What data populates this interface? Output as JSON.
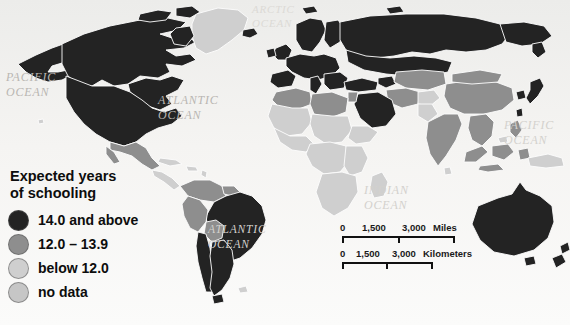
{
  "figure": {
    "type": "choropleth-world-map",
    "background_color": "#f4f3f1"
  },
  "legend": {
    "title": "Expected years\nof schooling",
    "items": [
      {
        "label": "14.0 and above",
        "color": "#232323"
      },
      {
        "label": "12.0 – 13.9",
        "color": "#8e8e8e"
      },
      {
        "label": "below 12.0",
        "color": "#cfcfcf"
      },
      {
        "label": "no data",
        "color": "#c6c6c6"
      }
    ]
  },
  "ocean_labels": [
    {
      "id": "arctic-ocean",
      "text": "ARCTIC\nOCEAN",
      "x": 252,
      "y": 2,
      "size": 11,
      "tone": "vfaint"
    },
    {
      "id": "pacific-ocean-west",
      "text": "PACIFIC\nOCEAN",
      "x": 6,
      "y": 70,
      "size": 12,
      "tone": "normal"
    },
    {
      "id": "atlantic-ocean-north",
      "text": "ATLANTIC\nOCEAN",
      "x": 158,
      "y": 93,
      "size": 12,
      "tone": "normal"
    },
    {
      "id": "pacific-ocean-east",
      "text": "PACIFIC\nOCEAN",
      "x": 504,
      "y": 118,
      "size": 12,
      "tone": "faint"
    },
    {
      "id": "indian-ocean",
      "text": "INDIAN\nOCEAN",
      "x": 364,
      "y": 183,
      "size": 12,
      "tone": "faint"
    },
    {
      "id": "atlantic-ocean-south",
      "text": "ATLANTIC\nOCEAN",
      "x": 208,
      "y": 222,
      "size": 11.5,
      "tone": "faint"
    }
  ],
  "scalebar": {
    "miles": {
      "unit_label": "Miles",
      "ticks": [
        "0",
        "1,500",
        "3,000"
      ]
    },
    "kilometers": {
      "unit_label": "Kilometers",
      "ticks": [
        "0",
        "1,500",
        "3,000"
      ]
    }
  },
  "chart_data": {
    "type": "map",
    "title": "Expected years of schooling",
    "classes": [
      {
        "label": "14.0 and above",
        "color": "#232323"
      },
      {
        "label": "12.0 – 13.9",
        "color": "#8e8e8e"
      },
      {
        "label": "below 12.0",
        "color": "#cfcfcf"
      },
      {
        "label": "no data",
        "color": "#c6c6c6"
      }
    ],
    "regions": [
      {
        "name": "Canada",
        "class": "14.0 and above"
      },
      {
        "name": "United States",
        "class": "14.0 and above"
      },
      {
        "name": "Greenland",
        "class": "below 12.0"
      },
      {
        "name": "Mexico",
        "class": "12.0 – 13.9"
      },
      {
        "name": "Central America",
        "class": "below 12.0"
      },
      {
        "name": "Caribbean",
        "class": "below 12.0"
      },
      {
        "name": "Venezuela",
        "class": "12.0 – 13.9"
      },
      {
        "name": "Colombia",
        "class": "12.0 – 13.9"
      },
      {
        "name": "Peru",
        "class": "12.0 – 13.9"
      },
      {
        "name": "Bolivia",
        "class": "12.0 – 13.9"
      },
      {
        "name": "Brazil",
        "class": "14.0 and above"
      },
      {
        "name": "Argentina",
        "class": "14.0 and above"
      },
      {
        "name": "Chile",
        "class": "14.0 and above"
      },
      {
        "name": "Western Europe",
        "class": "14.0 and above"
      },
      {
        "name": "Eastern Europe",
        "class": "14.0 and above"
      },
      {
        "name": "Russia",
        "class": "14.0 and above"
      },
      {
        "name": "North Africa",
        "class": "12.0 – 13.9"
      },
      {
        "name": "Sub-Saharan Africa",
        "class": "below 12.0"
      },
      {
        "name": "Saudi Arabia",
        "class": "14.0 and above"
      },
      {
        "name": "Iran",
        "class": "12.0 – 13.9"
      },
      {
        "name": "India",
        "class": "below 12.0"
      },
      {
        "name": "China",
        "class": "12.0 – 13.9"
      },
      {
        "name": "Southeast Asia",
        "class": "12.0 – 13.9"
      },
      {
        "name": "Japan",
        "class": "14.0 and above"
      },
      {
        "name": "Australia",
        "class": "14.0 and above"
      },
      {
        "name": "New Zealand",
        "class": "14.0 and above"
      }
    ]
  }
}
